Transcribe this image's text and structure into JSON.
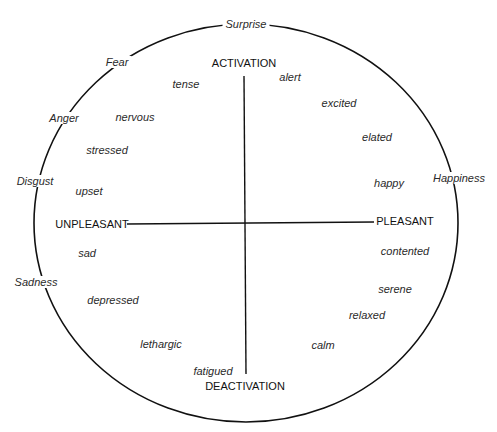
{
  "diagram": {
    "type": "circumplex-model-of-affect",
    "axes": {
      "top": "ACTIVATION",
      "bottom": "DEACTIVATION",
      "left": "UNPLEASANT",
      "right": "PLEASANT"
    },
    "basic_emotions": [
      {
        "label": "Surprise",
        "x": 246,
        "y": 24
      },
      {
        "label": "Fear",
        "x": 117,
        "y": 62
      },
      {
        "label": "Anger",
        "x": 64,
        "y": 118
      },
      {
        "label": "Disgust",
        "x": 35,
        "y": 181
      },
      {
        "label": "Happiness",
        "x": 459,
        "y": 178
      },
      {
        "label": "Sadness",
        "x": 36,
        "y": 282
      }
    ],
    "affect_words": [
      {
        "label": "tense",
        "x": 186,
        "y": 84
      },
      {
        "label": "alert",
        "x": 290,
        "y": 77
      },
      {
        "label": "nervous",
        "x": 135,
        "y": 117
      },
      {
        "label": "excited",
        "x": 339,
        "y": 103
      },
      {
        "label": "stressed",
        "x": 107,
        "y": 150
      },
      {
        "label": "elated",
        "x": 377,
        "y": 137
      },
      {
        "label": "upset",
        "x": 89,
        "y": 191
      },
      {
        "label": "happy",
        "x": 389,
        "y": 183
      },
      {
        "label": "sad",
        "x": 87,
        "y": 253
      },
      {
        "label": "contented",
        "x": 405,
        "y": 251
      },
      {
        "label": "depressed",
        "x": 113,
        "y": 300
      },
      {
        "label": "serene",
        "x": 395,
        "y": 289
      },
      {
        "label": "relaxed",
        "x": 367,
        "y": 315
      },
      {
        "label": "lethargic",
        "x": 161,
        "y": 344
      },
      {
        "label": "calm",
        "x": 323,
        "y": 345
      },
      {
        "label": "fatigued",
        "x": 213,
        "y": 371
      }
    ]
  }
}
